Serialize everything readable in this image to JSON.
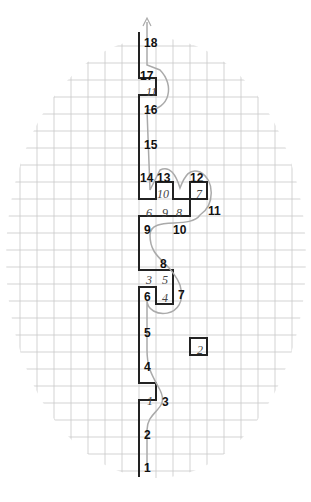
{
  "diagram": {
    "grid": {
      "cell_px": 17,
      "origin_x": 139,
      "color": "#c8c8c8"
    },
    "move_labels": [
      {
        "n": "1",
        "x": 144,
        "y": 462
      },
      {
        "n": "2",
        "x": 144,
        "y": 429
      },
      {
        "n": "3",
        "x": 162,
        "y": 396
      },
      {
        "n": "4",
        "x": 144,
        "y": 361
      },
      {
        "n": "5",
        "x": 144,
        "y": 327
      },
      {
        "n": "6",
        "x": 144,
        "y": 291
      },
      {
        "n": "7",
        "x": 178,
        "y": 289
      },
      {
        "n": "8",
        "x": 160,
        "y": 258
      },
      {
        "n": "9",
        "x": 144,
        "y": 224
      },
      {
        "n": "10",
        "x": 173,
        "y": 224
      },
      {
        "n": "11",
        "x": 208,
        "y": 205
      },
      {
        "n": "12",
        "x": 190,
        "y": 172
      },
      {
        "n": "13",
        "x": 157,
        "y": 172
      },
      {
        "n": "14",
        "x": 140,
        "y": 172
      },
      {
        "n": "15",
        "x": 144,
        "y": 139
      },
      {
        "n": "16",
        "x": 144,
        "y": 104
      },
      {
        "n": "17",
        "x": 140,
        "y": 70
      },
      {
        "n": "18",
        "x": 144,
        "y": 37
      }
    ],
    "piece_labels": [
      {
        "n": "1",
        "x": 147,
        "y": 395
      },
      {
        "n": "2",
        "x": 197,
        "y": 344
      },
      {
        "n": "3",
        "x": 146,
        "y": 274
      },
      {
        "n": "4",
        "x": 162,
        "y": 292
      },
      {
        "n": "5",
        "x": 162,
        "y": 274
      },
      {
        "n": "6",
        "x": 146,
        "y": 207
      },
      {
        "n": "7",
        "x": 196,
        "y": 188
      },
      {
        "n": "8",
        "x": 176,
        "y": 207
      },
      {
        "n": "9",
        "x": 162,
        "y": 207
      },
      {
        "n": "10",
        "x": 157,
        "y": 188
      },
      {
        "n": "11",
        "x": 146,
        "y": 86
      }
    ]
  }
}
